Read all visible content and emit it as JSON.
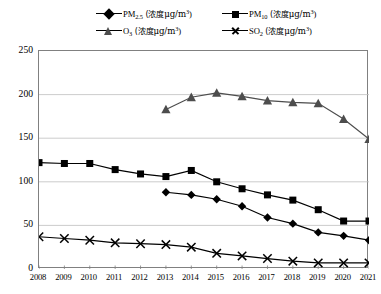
{
  "chart_data": {
    "type": "line",
    "title": "",
    "xlabel": "",
    "ylabel": "",
    "ylim": [
      0,
      250
    ],
    "ytick_labels": [
      "250",
      "200",
      "150",
      "100",
      "50",
      "0"
    ],
    "yticks": [
      250,
      200,
      150,
      100,
      50,
      0
    ],
    "grid": true,
    "legend_position": "top",
    "categories": [
      "2008",
      "2009",
      "2010",
      "2011",
      "2012",
      "2013",
      "2014",
      "2015",
      "2016",
      "2017",
      "2018",
      "2019",
      "2020",
      "2021"
    ],
    "x": [
      2008,
      2009,
      2010,
      2011,
      2012,
      2013,
      2014,
      2015,
      2016,
      2017,
      2018,
      2019,
      2020,
      2021
    ],
    "series": [
      {
        "name": "PM2.5 (浓度μg/m³)",
        "marker": "diamond",
        "color": "#000000",
        "x": [
          2013,
          2014,
          2015,
          2016,
          2017,
          2018,
          2019,
          2020,
          2021
        ],
        "values": [
          88,
          85,
          80,
          72,
          59,
          52,
          42,
          38,
          33
        ]
      },
      {
        "name": "PM10 (浓度μg/m³)",
        "marker": "square",
        "color": "#000000",
        "x": [
          2008,
          2009,
          2010,
          2011,
          2012,
          2013,
          2014,
          2015,
          2016,
          2017,
          2018,
          2019,
          2020,
          2021
        ],
        "values": [
          122,
          121,
          121,
          114,
          109,
          106,
          113,
          100,
          92,
          85,
          79,
          68,
          55,
          55
        ]
      },
      {
        "name": "O3 (浓度μg/m³)",
        "marker": "triangle",
        "color": "#4d4d4d",
        "x": [
          2013,
          2014,
          2015,
          2016,
          2017,
          2018,
          2019,
          2020,
          2021
        ],
        "values": [
          183,
          197,
          202,
          198,
          193,
          191,
          190,
          172,
          149
        ]
      },
      {
        "name": "SO2 (浓度μg/m³)",
        "marker": "cross",
        "color": "#000000",
        "x": [
          2008,
          2009,
          2010,
          2011,
          2012,
          2013,
          2014,
          2015,
          2016,
          2017,
          2018,
          2019,
          2020,
          2021
        ],
        "values": [
          37,
          35,
          33,
          30,
          29,
          28,
          25,
          18,
          15,
          12,
          9,
          7,
          7,
          7
        ]
      }
    ]
  },
  "legend": {
    "items": [
      {
        "id": "pm25",
        "marker": "diamond",
        "base": "PM",
        "sub": "2.5",
        "unit_prefix": " (浓度",
        "unit_mu": "μg/m",
        "unit_sup": "3",
        "unit_suffix": ")"
      },
      {
        "id": "pm10",
        "marker": "square",
        "base": "PM",
        "sub": "10",
        "unit_prefix": " (浓度",
        "unit_mu": "μg/m",
        "unit_sup": "3",
        "unit_suffix": ")"
      },
      {
        "id": "o3",
        "marker": "triangle",
        "base": "O",
        "sub": "3",
        "unit_prefix": " (浓度",
        "unit_mu": "μg/m",
        "unit_sup": "3",
        "unit_suffix": ")"
      },
      {
        "id": "so2",
        "marker": "cross",
        "base": "SO",
        "sub": "2",
        "unit_prefix": " (浓度",
        "unit_mu": "μg/m",
        "unit_sup": "3",
        "unit_suffix": ")"
      }
    ]
  },
  "colors": {
    "axis": "#808080",
    "grid": "#bfbfbf",
    "line_dark": "#000000",
    "line_gray": "#4d4d4d",
    "background": "#ffffff"
  }
}
